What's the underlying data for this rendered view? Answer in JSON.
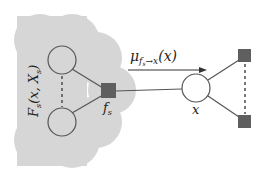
{
  "diagram": {
    "type": "factor-graph",
    "colors": {
      "cloud": "#d6d6d6",
      "node_stroke": "#555555",
      "node_fill": "#ffffff",
      "factor_fill": "#5f5f5f",
      "edge": "#555555",
      "text": "#222222"
    },
    "subgraph_label": {
      "F": "F",
      "sub": "s",
      "args": "(x, X",
      "args_sub": "s",
      "close": ")"
    },
    "factor_label": {
      "base": "f",
      "sub": "s"
    },
    "variable_label": "x",
    "message_label": {
      "mu": "μ",
      "sub": "f",
      "subsub": "s",
      "arrow_text": "→x",
      "args": "(x)"
    }
  }
}
